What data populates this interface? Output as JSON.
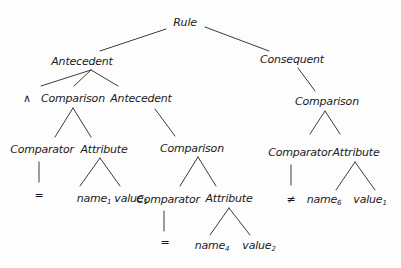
{
  "diagram": {
    "type": "parse-tree",
    "nodes": [
      {
        "id": "rule",
        "label": "Rule",
        "x": 185,
        "y": 22
      },
      {
        "id": "ant1",
        "label": "Antecedent",
        "x": 82,
        "y": 61
      },
      {
        "id": "cons",
        "label": "Consequent",
        "x": 292,
        "y": 59
      },
      {
        "id": "and",
        "label": "∧",
        "x": 27,
        "y": 98
      },
      {
        "id": "comp1",
        "label": "Comparison",
        "x": 73,
        "y": 98
      },
      {
        "id": "ant2",
        "label": "Antecedent",
        "x": 141,
        "y": 98
      },
      {
        "id": "comp3",
        "label": "Comparison",
        "x": 327,
        "y": 101
      },
      {
        "id": "cmpr1",
        "label": "Comparator",
        "x": 42,
        "y": 149
      },
      {
        "id": "attr1",
        "label": "Attribute",
        "x": 104,
        "y": 149
      },
      {
        "id": "comp2",
        "label": "Comparison",
        "x": 192,
        "y": 148
      },
      {
        "id": "cmpr3",
        "label": "Comparator",
        "x": 300,
        "y": 152
      },
      {
        "id": "attr3",
        "label": "Attribute",
        "x": 356,
        "y": 152
      },
      {
        "id": "eq1",
        "label": "=",
        "x": 39,
        "y": 195
      },
      {
        "id": "name1",
        "label": "name",
        "sub": "1",
        "x": 94,
        "y": 199
      },
      {
        "id": "value1",
        "label": "value",
        "sub": "1",
        "x": 131,
        "y": 199
      },
      {
        "id": "cmpr2",
        "label": "Comparator",
        "x": 168,
        "y": 199
      },
      {
        "id": "attr2",
        "label": "Attribute",
        "x": 229,
        "y": 198
      },
      {
        "id": "neq",
        "label": "≠",
        "x": 291,
        "y": 199
      },
      {
        "id": "name6",
        "label": "name",
        "sub": "6",
        "x": 324,
        "y": 200
      },
      {
        "id": "value1b",
        "label": "value",
        "sub": "1",
        "x": 370,
        "y": 200
      },
      {
        "id": "eq2",
        "label": "=",
        "x": 165,
        "y": 242
      },
      {
        "id": "name4",
        "label": "name",
        "sub": "4",
        "x": 212,
        "y": 246
      },
      {
        "id": "value2",
        "label": "value",
        "sub": "2",
        "x": 259,
        "y": 246
      }
    ],
    "edges": [
      {
        "x1": 166,
        "y1": 29,
        "x2": 100,
        "y2": 51
      },
      {
        "x1": 205,
        "y1": 27,
        "x2": 269,
        "y2": 51
      },
      {
        "x1": 91,
        "y1": 70,
        "x2": 41,
        "y2": 86
      },
      {
        "x1": 91,
        "y1": 70,
        "x2": 74,
        "y2": 86
      },
      {
        "x1": 91,
        "y1": 70,
        "x2": 118,
        "y2": 86
      },
      {
        "x1": 73,
        "y1": 108,
        "x2": 55,
        "y2": 137
      },
      {
        "x1": 73,
        "y1": 108,
        "x2": 91,
        "y2": 137
      },
      {
        "x1": 155,
        "y1": 109,
        "x2": 175,
        "y2": 136
      },
      {
        "x1": 298,
        "y1": 68,
        "x2": 315,
        "y2": 91
      },
      {
        "x1": 325,
        "y1": 111,
        "x2": 310,
        "y2": 134
      },
      {
        "x1": 325,
        "y1": 111,
        "x2": 340,
        "y2": 134
      },
      {
        "x1": 39,
        "y1": 162,
        "x2": 39,
        "y2": 182
      },
      {
        "x1": 100,
        "y1": 158,
        "x2": 80,
        "y2": 186
      },
      {
        "x1": 100,
        "y1": 158,
        "x2": 120,
        "y2": 186
      },
      {
        "x1": 198,
        "y1": 157,
        "x2": 180,
        "y2": 186
      },
      {
        "x1": 198,
        "y1": 157,
        "x2": 216,
        "y2": 186
      },
      {
        "x1": 291,
        "y1": 165,
        "x2": 291,
        "y2": 185
      },
      {
        "x1": 355,
        "y1": 162,
        "x2": 336,
        "y2": 190
      },
      {
        "x1": 355,
        "y1": 162,
        "x2": 375,
        "y2": 190
      },
      {
        "x1": 164,
        "y1": 211,
        "x2": 164,
        "y2": 231
      },
      {
        "x1": 229,
        "y1": 208,
        "x2": 210,
        "y2": 235
      },
      {
        "x1": 229,
        "y1": 208,
        "x2": 250,
        "y2": 235
      }
    ],
    "line_color": "#3a3a3a",
    "text_color": "#1a1a1a"
  }
}
